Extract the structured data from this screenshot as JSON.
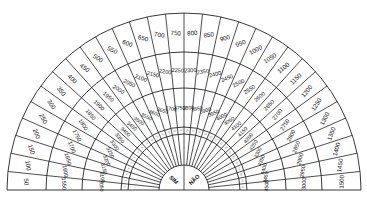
{
  "chart_data": {
    "type": "radial-dial",
    "title": "",
    "center": {
      "x": 184,
      "y": 190
    },
    "sectors": 30,
    "radii": {
      "outer": 177,
      "ring1": 138,
      "ring2": 102,
      "ring3": 63,
      "ring4": 56,
      "center": 25
    },
    "rings": [
      {
        "name": "outer",
        "values": [
          50,
          100,
          150,
          200,
          250,
          300,
          350,
          400,
          450,
          500,
          550,
          600,
          650,
          700,
          750,
          800,
          850,
          900,
          950,
          1000,
          1050,
          1100,
          1150,
          1200,
          1250,
          1300,
          1350,
          1400,
          1450,
          1500
        ]
      },
      {
        "name": "middle",
        "values": [
          1550,
          1600,
          1650,
          1700,
          1750,
          1800,
          1850,
          1900,
          1950,
          2000,
          2050,
          2100,
          2150,
          2200,
          2250,
          2300,
          2350,
          2400,
          2450,
          2500,
          2550,
          2600,
          2650,
          2700,
          2750,
          2800,
          2850,
          2900,
          2950,
          3000
        ]
      },
      {
        "name": "inner",
        "values": [
          3050,
          3100,
          3150,
          3200,
          3250,
          3300,
          3350,
          3400,
          3450,
          3500,
          3550,
          3600,
          3650,
          3700,
          3750,
          3800,
          3850,
          3900,
          3950,
          4000,
          4050,
          4100,
          4150,
          4200,
          4250,
          4300,
          4350,
          4400,
          4450,
          4500
        ]
      },
      {
        "name": "index",
        "values": [
          1,
          2,
          3,
          4,
          5,
          6,
          7,
          8,
          9,
          10,
          11,
          12,
          13,
          14,
          15,
          16,
          17,
          18,
          19,
          20,
          21,
          22,
          23,
          24,
          25,
          26,
          27,
          28,
          29,
          30
        ]
      }
    ],
    "center_labels": {
      "left": "NÃO",
      "right": "SIM"
    }
  }
}
